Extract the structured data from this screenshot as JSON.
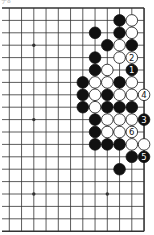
{
  "diagram": {
    "type": "go-board-partial",
    "caption": "ナ8",
    "grid": {
      "cols": 12,
      "rows": 19,
      "x0": 9.3,
      "dx": 12.25,
      "y0": 8,
      "dy": 12.4,
      "left_extends_to": 2,
      "edges": {
        "top": true,
        "right": true,
        "bottom": true,
        "left": false
      }
    },
    "star_points": [
      {
        "c": 2,
        "r": 3
      },
      {
        "c": 2,
        "r": 9
      },
      {
        "c": 2,
        "r": 15
      },
      {
        "c": 8,
        "r": 15
      }
    ],
    "colors": {
      "line": "#333333",
      "black_stone": "#111111",
      "white_stone": "#ffffff",
      "stone_outline": "#111111"
    },
    "stones": [
      {
        "c": 9,
        "r": 1,
        "color": "black"
      },
      {
        "c": 10,
        "r": 1,
        "color": "white"
      },
      {
        "c": 7,
        "r": 2,
        "color": "black"
      },
      {
        "c": 9,
        "r": 2,
        "color": "black"
      },
      {
        "c": 10,
        "r": 2,
        "color": "white"
      },
      {
        "c": 8,
        "r": 3,
        "color": "black"
      },
      {
        "c": 9,
        "r": 3,
        "color": "white"
      },
      {
        "c": 10,
        "r": 3,
        "color": "black"
      },
      {
        "c": 7,
        "r": 4,
        "color": "black"
      },
      {
        "c": 9,
        "r": 4,
        "color": "white"
      },
      {
        "c": 10,
        "r": 4,
        "color": "white",
        "label": "2"
      },
      {
        "c": 7,
        "r": 5,
        "color": "black"
      },
      {
        "c": 8,
        "r": 5,
        "color": "white"
      },
      {
        "c": 10,
        "r": 5,
        "color": "black",
        "label": "1"
      },
      {
        "c": 6,
        "r": 6,
        "color": "black"
      },
      {
        "c": 7,
        "r": 6,
        "color": "white"
      },
      {
        "c": 8,
        "r": 6,
        "color": "white"
      },
      {
        "c": 9,
        "r": 6,
        "color": "black"
      },
      {
        "c": 10,
        "r": 6,
        "color": "white"
      },
      {
        "c": 6,
        "r": 7,
        "color": "black"
      },
      {
        "c": 7,
        "r": 7,
        "color": "white"
      },
      {
        "c": 8,
        "r": 7,
        "color": "black"
      },
      {
        "c": 9,
        "r": 7,
        "color": "white"
      },
      {
        "c": 10,
        "r": 7,
        "color": "white"
      },
      {
        "c": 11,
        "r": 7,
        "color": "white",
        "label": "4"
      },
      {
        "c": 6,
        "r": 8,
        "color": "black"
      },
      {
        "c": 7,
        "r": 8,
        "color": "white"
      },
      {
        "c": 8,
        "r": 8,
        "color": "black"
      },
      {
        "c": 9,
        "r": 8,
        "color": "black"
      },
      {
        "c": 10,
        "r": 8,
        "color": "black"
      },
      {
        "c": 7,
        "r": 9,
        "color": "black"
      },
      {
        "c": 8,
        "r": 9,
        "color": "white"
      },
      {
        "c": 9,
        "r": 9,
        "color": "white"
      },
      {
        "c": 10,
        "r": 9,
        "color": "white"
      },
      {
        "c": 11,
        "r": 9,
        "color": "black",
        "label": "3"
      },
      {
        "c": 7,
        "r": 10,
        "color": "black"
      },
      {
        "c": 8,
        "r": 10,
        "color": "white"
      },
      {
        "c": 9,
        "r": 10,
        "color": "white"
      },
      {
        "c": 10,
        "r": 10,
        "color": "white",
        "label": "6"
      },
      {
        "c": 7,
        "r": 11,
        "color": "black"
      },
      {
        "c": 8,
        "r": 11,
        "color": "black"
      },
      {
        "c": 9,
        "r": 11,
        "color": "black"
      },
      {
        "c": 10,
        "r": 11,
        "color": "white"
      },
      {
        "c": 11,
        "r": 11,
        "color": "white"
      },
      {
        "c": 10,
        "r": 12,
        "color": "black"
      },
      {
        "c": 11,
        "r": 12,
        "color": "black",
        "label": "5"
      },
      {
        "c": 9,
        "r": 13,
        "color": "black"
      }
    ]
  }
}
